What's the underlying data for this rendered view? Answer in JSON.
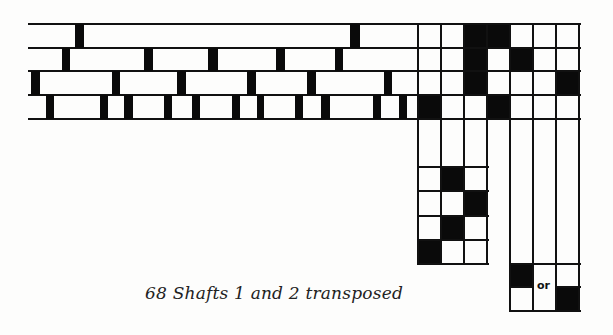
{
  "figure": {
    "caption": "68 Shafts 1 and 2 transposed",
    "or_label": "or",
    "colors": {
      "ink": "#0a0a0a",
      "paper": "#fdfdfc"
    }
  },
  "fabric": {
    "x_start": 28,
    "x_end": 418,
    "row_lines_y": [
      24,
      48,
      71,
      95,
      119
    ],
    "rows": [
      {
        "marks_x": [
          [
            75,
            84
          ],
          [
            350,
            360
          ]
        ]
      },
      {
        "marks_x": [
          [
            62,
            70
          ],
          [
            144,
            153
          ],
          [
            208,
            218
          ],
          [
            276,
            285
          ],
          [
            335,
            343
          ]
        ]
      },
      {
        "marks_x": [
          [
            31,
            40
          ],
          [
            112,
            120
          ],
          [
            177,
            186
          ],
          [
            247,
            256
          ],
          [
            307,
            316
          ],
          [
            384,
            392
          ]
        ]
      },
      {
        "marks_x": [
          [
            46,
            54
          ],
          [
            100,
            108
          ],
          [
            124,
            133
          ],
          [
            164,
            172
          ],
          [
            192,
            200
          ],
          [
            232,
            240
          ],
          [
            257,
            264
          ],
          [
            295,
            303
          ],
          [
            321,
            330
          ],
          [
            373,
            381
          ],
          [
            399,
            407
          ]
        ]
      }
    ]
  },
  "threading_grid": {
    "cols_x": [
      418,
      441,
      464,
      487,
      510,
      533,
      556,
      579
    ],
    "rows_y": [
      24,
      48,
      71,
      95,
      119
    ],
    "filled": [
      [
        0,
        2
      ],
      [
        0,
        3
      ],
      [
        1,
        2
      ],
      [
        1,
        4
      ],
      [
        2,
        2
      ],
      [
        2,
        6
      ],
      [
        3,
        0
      ],
      [
        3,
        3
      ]
    ]
  },
  "treadling_left": {
    "cols_x": [
      418,
      441,
      464,
      487
    ],
    "top_y": 119,
    "rows_y": [
      167,
      191,
      216,
      240,
      264
    ],
    "filled": [
      [
        0,
        1
      ],
      [
        1,
        2
      ],
      [
        2,
        1
      ],
      [
        3,
        0
      ]
    ]
  },
  "treadling_right": {
    "cols_x": [
      510,
      533,
      556,
      579
    ],
    "top_y": 119,
    "rows_y": [
      264,
      287,
      311
    ],
    "filled": [
      [
        0,
        0
      ],
      [
        1,
        2
      ]
    ]
  }
}
